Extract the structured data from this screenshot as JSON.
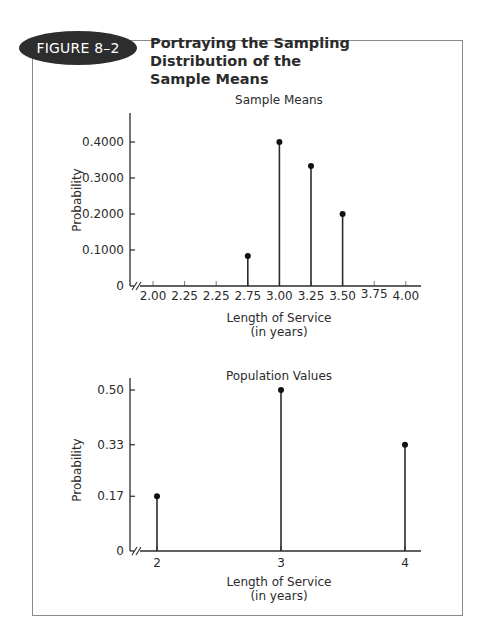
{
  "figure": {
    "badge": "FIGURE 8–2",
    "title_line1": "Portraying the Sampling Distribution of the",
    "title_line2": "Sample Means"
  },
  "chart_data": [
    {
      "type": "line",
      "subtype": "stem",
      "title": "Sample Means",
      "xlabel": "Length of Service",
      "xlabel_sub": "(in years)",
      "ylabel": "Probability",
      "x_tick_labels": [
        "2.00",
        "2.25",
        "2.25",
        "2.75",
        "3.00",
        "3.25",
        "3.50",
        "3.75",
        "4.00"
      ],
      "x_tick_values": [
        2.0,
        2.25,
        2.5,
        2.75,
        3.0,
        3.25,
        3.5,
        3.75,
        4.0
      ],
      "y_ticks": [
        0,
        0.1,
        0.2,
        0.3,
        0.4
      ],
      "y_tick_labels": [
        "0",
        "0.1000",
        "0.2000",
        "0.3000",
        "0.4000"
      ],
      "ylim": [
        0,
        0.47
      ],
      "axis_break": true,
      "grid": false,
      "points": [
        {
          "x": 2.75,
          "y": 0.0833
        },
        {
          "x": 3.0,
          "y": 0.4
        },
        {
          "x": 3.25,
          "y": 0.3333
        },
        {
          "x": 3.5,
          "y": 0.2
        }
      ]
    },
    {
      "type": "line",
      "subtype": "stem",
      "title": "Population Values",
      "xlabel": "Length of Service",
      "xlabel_sub": "(in years)",
      "ylabel": "Probability",
      "x_tick_labels": [
        "2",
        "3",
        "4"
      ],
      "x_tick_values": [
        2,
        3,
        4
      ],
      "y_ticks": [
        0,
        0.17,
        0.33,
        0.5
      ],
      "y_tick_labels": [
        "0",
        "0.17",
        "0.33",
        "0.50"
      ],
      "ylim": [
        0,
        0.54
      ],
      "axis_break": true,
      "grid": false,
      "points": [
        {
          "x": 2,
          "y": 0.17
        },
        {
          "x": 3,
          "y": 0.5
        },
        {
          "x": 4,
          "y": 0.33
        }
      ]
    }
  ],
  "colors": {
    "ink": "#2b2b2b",
    "badge_bg": "#2d2d2d",
    "frame": "#8a8a8a"
  }
}
